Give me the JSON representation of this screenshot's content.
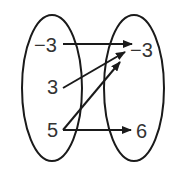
{
  "diagram": {
    "type": "mapping-diagram",
    "domain": [
      "−3",
      "3",
      "5"
    ],
    "range": [
      "−3",
      "6"
    ],
    "mappings": [
      {
        "from": "−3",
        "to": "−3"
      },
      {
        "from": "3",
        "to": "−3"
      },
      {
        "from": "5",
        "to": "−3"
      },
      {
        "from": "5",
        "to": "6"
      }
    ],
    "colors": {
      "stroke": "#1a1a1a",
      "text": "#333333",
      "background": "#ffffff"
    }
  }
}
